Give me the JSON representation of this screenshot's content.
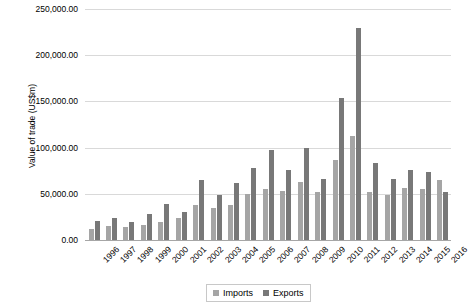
{
  "chart_data": {
    "type": "bar",
    "title": "",
    "xlabel": "",
    "ylabel": "Value of trade (US$m)",
    "ylim": [
      0,
      250000
    ],
    "ytick_labels": [
      "250,000.00",
      "200,000.00",
      "150,000.00",
      "100,000.00",
      "50,000.00",
      "0.00"
    ],
    "ytick_values": [
      250000,
      200000,
      150000,
      100000,
      50000,
      0
    ],
    "grid": true,
    "legend_position": "bottom",
    "categories": [
      "1996",
      "1997",
      "1998",
      "1999",
      "2000",
      "2001",
      "2002",
      "2003",
      "2004",
      "2005",
      "2006",
      "2007",
      "2008",
      "2009",
      "2010",
      "2011",
      "2012",
      "2013",
      "2014",
      "2015",
      "2016"
    ],
    "series": [
      {
        "name": "Imports",
        "color": "#a5a5a5",
        "values": [
          12000,
          15000,
          14000,
          16000,
          20000,
          24000,
          38000,
          35000,
          38000,
          50000,
          55000,
          53000,
          63000,
          52000,
          87000,
          113000,
          52000,
          49000,
          56000,
          55000,
          65000
        ]
      },
      {
        "name": "Exports",
        "color": "#787878",
        "values": [
          21000,
          24000,
          20000,
          28000,
          39000,
          30000,
          65000,
          49000,
          62000,
          78000,
          97000,
          76000,
          100000,
          66000,
          154000,
          229000,
          83000,
          66000,
          76000,
          74000,
          52000
        ]
      }
    ]
  },
  "legend": {
    "items": [
      {
        "label": "Imports",
        "color": "#a5a5a5"
      },
      {
        "label": "Exports",
        "color": "#787878"
      }
    ]
  }
}
